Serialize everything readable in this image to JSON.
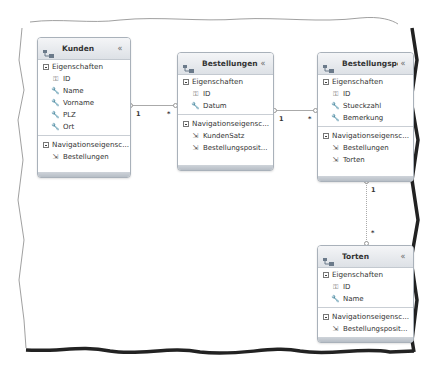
{
  "diagram": {
    "entities": [
      {
        "title": "Kunden",
        "properties_header": "Eigenschaften",
        "properties": [
          {
            "name": "ID",
            "icon": "key-icon"
          },
          {
            "name": "Name",
            "icon": "wrench-icon"
          },
          {
            "name": "Vorname",
            "icon": "wrench-icon"
          },
          {
            "name": "PLZ",
            "icon": "wrench-icon"
          },
          {
            "name": "Ort",
            "icon": "wrench-icon"
          }
        ],
        "nav_header": "Navigationseigensc...",
        "navigation": [
          {
            "name": "Bestellungen",
            "icon": "navigation-property-icon"
          }
        ]
      },
      {
        "title": "Bestellungen",
        "properties_header": "Eigenschaften",
        "properties": [
          {
            "name": "ID",
            "icon": "key-icon"
          },
          {
            "name": "Datum",
            "icon": "wrench-icon"
          }
        ],
        "nav_header": "Navigationseigensc...",
        "navigation": [
          {
            "name": "KundenSatz",
            "icon": "navigation-property-icon"
          },
          {
            "name": "Bestellungsposit...",
            "icon": "navigation-property-icon"
          }
        ]
      },
      {
        "title": "Bestellungspo...",
        "properties_header": "Eigenschaften",
        "properties": [
          {
            "name": "ID",
            "icon": "key-icon"
          },
          {
            "name": "Stueckzahl",
            "icon": "wrench-icon"
          },
          {
            "name": "Bemerkung",
            "icon": "wrench-icon"
          }
        ],
        "nav_header": "Navigationseigensc...",
        "navigation": [
          {
            "name": "Bestellungen",
            "icon": "navigation-property-icon"
          },
          {
            "name": "Torten",
            "icon": "navigation-property-icon"
          }
        ]
      },
      {
        "title": "Torten",
        "properties_header": "Eigenschaften",
        "properties": [
          {
            "name": "ID",
            "icon": "key-icon"
          },
          {
            "name": "Name",
            "icon": "wrench-icon"
          }
        ],
        "nav_header": "Navigationseigensc...",
        "navigation": [
          {
            "name": "Bestellungsposit...",
            "icon": "navigation-property-icon"
          }
        ]
      }
    ],
    "associations": [
      {
        "from": "Kunden",
        "to": "Bestellungen",
        "from_mult": "1",
        "to_mult": "*"
      },
      {
        "from": "Bestellungen",
        "to": "Bestellungspo...",
        "from_mult": "1",
        "to_mult": "*"
      },
      {
        "from": "Bestellungspo...",
        "to": "Torten",
        "from_mult": "1",
        "to_mult": "*"
      }
    ],
    "collapse_glyph": "«",
    "colors": {
      "header_top": "#f4f5f7",
      "header_bottom": "#dde1e6",
      "border": "#a9b1ba",
      "connector": "#aaaaaa"
    }
  }
}
